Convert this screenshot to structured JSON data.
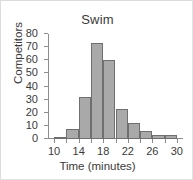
{
  "chart_data": {
    "type": "bar",
    "title": "Swim",
    "xlabel": "Time (minutes)",
    "ylabel": "Competitors",
    "grid": false,
    "legend": false,
    "bin_width": 2,
    "xlim": [
      9,
      31
    ],
    "ylim": [
      0,
      80
    ],
    "ytick_step": 10,
    "yticks": [
      0,
      10,
      20,
      30,
      40,
      50,
      60,
      70,
      80
    ],
    "ytick_labels": [
      "0",
      "10",
      "20",
      "30",
      "40",
      "50",
      "60",
      "70",
      "80"
    ],
    "xticks": [
      10,
      12,
      14,
      16,
      18,
      20,
      22,
      24,
      26,
      28,
      30
    ],
    "xtick_labels_shown": [
      "10",
      "14",
      "18",
      "22",
      "26",
      "30"
    ],
    "xtick_label_values": [
      10,
      14,
      18,
      22,
      26,
      30
    ],
    "categories": [
      "10-12",
      "12-14",
      "14-16",
      "16-18",
      "18-20",
      "20-22",
      "22-24",
      "24-26",
      "26-28",
      "28-30"
    ],
    "bin_starts": [
      10,
      12,
      14,
      16,
      18,
      20,
      22,
      24,
      26,
      28
    ],
    "values": [
      1,
      8,
      32,
      73,
      60,
      23,
      12,
      6,
      3,
      3
    ],
    "colors": {
      "bar_fill": "#a9a9a9",
      "bar_edge": "#6f6f6f",
      "axis": "#8c8c8c",
      "text": "#3a3a3a",
      "background": "#ffffff",
      "frame": "#e3e3e3"
    }
  }
}
